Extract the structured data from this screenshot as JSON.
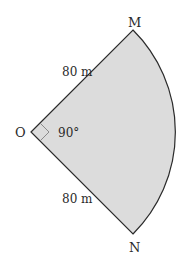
{
  "diagram": {
    "type": "circle-sector",
    "colors": {
      "fill": "#dcdcdc",
      "stroke": "#2b2b2b",
      "angle_marker": "#8a8a8a",
      "text": "#2a2a2a"
    },
    "points": {
      "O": {
        "label": "O"
      },
      "M": {
        "label": "M"
      },
      "N": {
        "label": "N"
      }
    },
    "radius_labels": {
      "OM": "80 m",
      "ON": "80 m"
    },
    "angle_label": "90°"
  }
}
